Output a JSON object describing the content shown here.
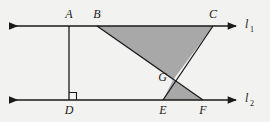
{
  "figure": {
    "type": "geometry-diagram",
    "background_color": "#f2f2f0",
    "stroke_color": "#1a1a1a",
    "shade_color": "#a8a8a8",
    "lines": [
      {
        "name": "l1",
        "label": "l",
        "subscript": "1",
        "label_x": 247,
        "label_y": 27,
        "y": 26,
        "x_start": 8,
        "x_end": 238,
        "arrows": "both"
      },
      {
        "name": "l2",
        "label": "l",
        "subscript": "2",
        "label_x": 247,
        "label_y": 101,
        "y": 100,
        "x_start": 8,
        "x_end": 238,
        "arrows": "both"
      }
    ],
    "points": [
      {
        "id": "A",
        "label": "A",
        "x": 69,
        "y": 26,
        "label_x": 69,
        "label_y": 18,
        "anchor": "middle"
      },
      {
        "id": "B",
        "label": "B",
        "x": 97,
        "y": 26,
        "label_x": 97,
        "label_y": 18,
        "anchor": "middle"
      },
      {
        "id": "C",
        "label": "C",
        "x": 213,
        "y": 26,
        "label_x": 213,
        "label_y": 18,
        "anchor": "middle"
      },
      {
        "id": "D",
        "label": "D",
        "x": 69,
        "y": 100,
        "label_x": 69,
        "label_y": 114,
        "anchor": "middle"
      },
      {
        "id": "E",
        "label": "E",
        "x": 163,
        "y": 100,
        "label_x": 163,
        "label_y": 114,
        "anchor": "middle"
      },
      {
        "id": "F",
        "label": "F",
        "x": 203,
        "y": 100,
        "label_x": 203,
        "label_y": 114,
        "anchor": "middle"
      },
      {
        "id": "G",
        "label": "G",
        "x": 173,
        "y": 80,
        "label_x": 166,
        "label_y": 80,
        "anchor": "end"
      }
    ],
    "segments": [
      {
        "name": "AD",
        "from": "A",
        "to": "D",
        "x1": 69,
        "y1": 26,
        "x2": 69,
        "y2": 100
      },
      {
        "name": "BF",
        "from": "B",
        "to": "F",
        "x1": 97,
        "y1": 26,
        "x2": 203,
        "y2": 100
      },
      {
        "name": "CE",
        "from": "C",
        "to": "E",
        "x1": 213,
        "y1": 26,
        "x2": 163,
        "y2": 100
      }
    ],
    "shaded_regions": [
      {
        "name": "triangle-BCG",
        "vertices": "B,C,G",
        "points": "97,26 213,26 173,80",
        "fill": "#a8a8a8"
      },
      {
        "name": "triangle-GEF",
        "vertices": "G,E,F",
        "points": "173,80 163,100 203,100",
        "fill": "#a8a8a8"
      }
    ],
    "right_angle": {
      "name": "right-angle-at-D",
      "at_point": "D",
      "size": 7,
      "x": 69,
      "y": 100
    }
  }
}
